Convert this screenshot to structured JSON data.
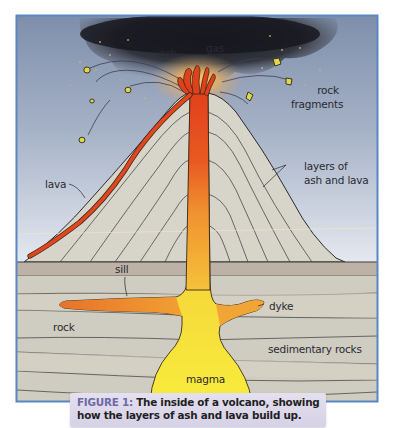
{
  "figure": {
    "caption": {
      "number": "FIGURE 1:",
      "text_line1": " The inside of a volcano, showing",
      "text_line2": "how the layers of ash and lava build up."
    },
    "labels": {
      "ash": "ash",
      "gas": "gas",
      "rock_fragments_1": "rock",
      "rock_fragments_2": "fragments",
      "lava": "lava",
      "layers_1": "layers of",
      "layers_2": "ash and lava",
      "sill": "sill",
      "dyke": "dyke",
      "rock": "rock",
      "sedimentary_rocks": "sedimentary rocks",
      "magma": "magma"
    },
    "colors": {
      "frame_border": "#5b86c4",
      "sky_top": "#8c9bb4",
      "sky_bottom": "#dfe5ee",
      "ash_cloud": "#1e1f26",
      "volcano_cone": "#d6d3c9",
      "ground_band": "#bdb2a6",
      "strata": "#cfcbc0",
      "lava": "#e2461f",
      "magma_top": "#ee7a2a",
      "magma_bottom": "#f7e63a",
      "rock_fragment": "#e4d546",
      "caption_bg": "#dcd8ea",
      "caption_accent": "#6c6aa8"
    }
  }
}
